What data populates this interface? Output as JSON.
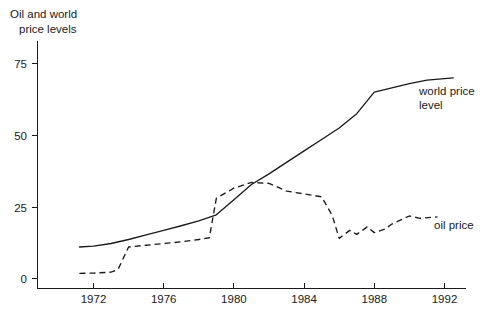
{
  "chart_data": {
    "type": "line",
    "title": "Oil and world price levels",
    "title_lines": [
      "Oil and world",
      "price levels"
    ],
    "xlabel": "",
    "ylabel": "",
    "xlim": [
      1971.2,
      1992.5
    ],
    "ylim": [
      0,
      80
    ],
    "grid": false,
    "legend_position": "right-inline-annotations",
    "xticks": [
      1972,
      1976,
      1980,
      1984,
      1988,
      1992
    ],
    "xticklabels": [
      "1972",
      "1976",
      "1980",
      "1984",
      "1988",
      "1992"
    ],
    "yticks": [
      0,
      25,
      50,
      75
    ],
    "yticklabels": [
      "0",
      "25",
      "50",
      "75"
    ],
    "series": [
      {
        "name": "world price level",
        "label": "world price level",
        "label_lines": [
          "world price",
          "level"
        ],
        "style": "solid",
        "color": "#1a1a1a",
        "x": [
          1971.2,
          1972,
          1973,
          1974,
          1975,
          1976,
          1977,
          1978,
          1979,
          1980,
          1981,
          1982,
          1983,
          1984,
          1985,
          1986,
          1987,
          1988,
          1989,
          1990,
          1991,
          1992.5
        ],
        "values": [
          11,
          11.3,
          12.2,
          13.6,
          15.2,
          16.8,
          18.4,
          20.1,
          22.2,
          27.5,
          32.8,
          36.5,
          40.5,
          44.5,
          48.5,
          52.5,
          57.5,
          65,
          66.5,
          68,
          69.2,
          70
        ]
      },
      {
        "name": "oil price",
        "label": "oil price",
        "label_lines": [
          "oil price"
        ],
        "style": "dashed",
        "color": "#1a1a1a",
        "x": [
          1971.2,
          1972,
          1973,
          1973.4,
          1974,
          1975,
          1976,
          1977,
          1978,
          1978.6,
          1979,
          1980,
          1981,
          1982,
          1983,
          1984,
          1985,
          1985.6,
          1986,
          1986.6,
          1987,
          1987.6,
          1988,
          1988.6,
          1989,
          1990,
          1990.6,
          1991.6
        ],
        "values": [
          1.8,
          1.9,
          2.2,
          3.2,
          11,
          11.6,
          12.2,
          12.8,
          13.6,
          14.2,
          28,
          31.5,
          33.5,
          33.2,
          30.5,
          29.5,
          28.5,
          22,
          14,
          16.8,
          15.4,
          18,
          16,
          17.2,
          19,
          21.8,
          21,
          21.5
        ]
      }
    ]
  },
  "axes": {
    "y_axis_name": "value-axis",
    "x_axis_name": "year-axis"
  }
}
